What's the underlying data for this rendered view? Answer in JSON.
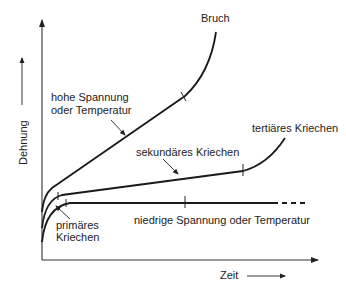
{
  "diagram": {
    "type": "creep-curves",
    "axes": {
      "y_label": "Dehnung",
      "x_label": "Zeit"
    },
    "labels": {
      "bruch": "Bruch",
      "high_line1": "hohe Spannung",
      "high_line2": "oder Temperatur",
      "sekundaer": "sekundäres Kriechen",
      "tertiaer": "tertiäres Kriechen",
      "primaer_line1": "primäres",
      "primaer_line2": "Kriechen",
      "low": "niedrige Spannung oder Temperatur"
    },
    "curves": [
      {
        "name": "high-stress",
        "description": "hohe Spannung oder Temperatur",
        "ends_in": "Bruch"
      },
      {
        "name": "medium-stress",
        "description": "sekundäres → tertiäres Kriechen"
      },
      {
        "name": "low-stress",
        "description": "niedrige Spannung oder Temperatur",
        "continues_dashed": true
      }
    ]
  }
}
